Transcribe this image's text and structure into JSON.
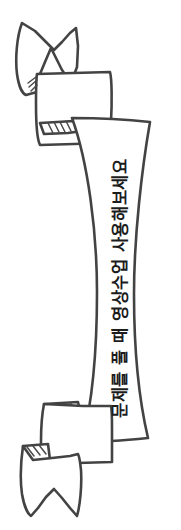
{
  "illustration": {
    "kind": "hand-drawn-ribbon-banner",
    "orientation": "vertical",
    "title": "ribbon-banner-illustration"
  },
  "banner": {
    "text": "문제를 풀 때 영상수업 사용해보세요",
    "text_rotation_degrees": "90",
    "reading_direction": "bottom-to-top"
  },
  "colors": {
    "stroke": "#434343",
    "stroke_light": "#4a4a4a",
    "fill": "#ffffff",
    "text": "#1c1c1c",
    "background": "#ffffff"
  },
  "parts": {
    "top_tail_label": "top-swallowtail-end",
    "top_fold_label": "top-fold-segment",
    "main_band_label": "main-curved-band",
    "bottom_fold_label": "bottom-fold-segment",
    "bottom_tail_label": "bottom-swallowtail-end"
  }
}
